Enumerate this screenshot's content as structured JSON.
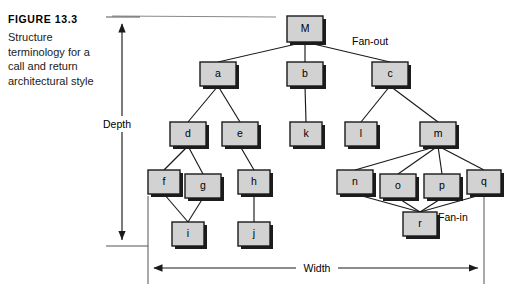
{
  "figure": {
    "label": "FIGURE 13.3",
    "description": "Structure terminology for a call and return architectural style"
  },
  "diagram": {
    "annotations": {
      "fan_out": "Fan-out",
      "fan_in": "Fan-in",
      "depth": "Depth",
      "width": "Width"
    },
    "nodes": [
      {
        "id": "M",
        "label": "M",
        "x": 287,
        "y": 16,
        "w": 36,
        "h": 26
      },
      {
        "id": "a",
        "label": "a",
        "x": 200,
        "y": 62,
        "w": 36,
        "h": 24
      },
      {
        "id": "b",
        "label": "b",
        "x": 287,
        "y": 62,
        "w": 36,
        "h": 24
      },
      {
        "id": "c",
        "label": "c",
        "x": 372,
        "y": 62,
        "w": 36,
        "h": 24
      },
      {
        "id": "d",
        "label": "d",
        "x": 170,
        "y": 122,
        "w": 36,
        "h": 24
      },
      {
        "id": "e",
        "label": "e",
        "x": 222,
        "y": 122,
        "w": 36,
        "h": 24
      },
      {
        "id": "k",
        "label": "k",
        "x": 290,
        "y": 122,
        "w": 32,
        "h": 24
      },
      {
        "id": "l",
        "label": "l",
        "x": 345,
        "y": 122,
        "w": 32,
        "h": 24
      },
      {
        "id": "m",
        "label": "m",
        "x": 420,
        "y": 122,
        "w": 36,
        "h": 24
      },
      {
        "id": "f",
        "label": "f",
        "x": 148,
        "y": 170,
        "w": 32,
        "h": 24
      },
      {
        "id": "g",
        "label": "g",
        "x": 185,
        "y": 174,
        "w": 36,
        "h": 24
      },
      {
        "id": "h",
        "label": "h",
        "x": 238,
        "y": 170,
        "w": 32,
        "h": 24
      },
      {
        "id": "n",
        "label": "n",
        "x": 337,
        "y": 170,
        "w": 36,
        "h": 24
      },
      {
        "id": "o",
        "label": "o",
        "x": 380,
        "y": 174,
        "w": 36,
        "h": 24
      },
      {
        "id": "p",
        "label": "p",
        "x": 424,
        "y": 174,
        "w": 36,
        "h": 24
      },
      {
        "id": "q",
        "label": "q",
        "x": 467,
        "y": 170,
        "w": 34,
        "h": 24
      },
      {
        "id": "i",
        "label": "i",
        "x": 172,
        "y": 222,
        "w": 32,
        "h": 24
      },
      {
        "id": "j",
        "label": "j",
        "x": 238,
        "y": 222,
        "w": 32,
        "h": 24
      },
      {
        "id": "r",
        "label": "r",
        "x": 403,
        "y": 212,
        "w": 34,
        "h": 24
      }
    ],
    "edges": [
      {
        "from": "M",
        "to": "a"
      },
      {
        "from": "M",
        "to": "b"
      },
      {
        "from": "M",
        "to": "c"
      },
      {
        "from": "a",
        "to": "d"
      },
      {
        "from": "a",
        "to": "e"
      },
      {
        "from": "b",
        "to": "k"
      },
      {
        "from": "c",
        "to": "l"
      },
      {
        "from": "c",
        "to": "m"
      },
      {
        "from": "d",
        "to": "f"
      },
      {
        "from": "d",
        "to": "g"
      },
      {
        "from": "e",
        "to": "h"
      },
      {
        "from": "m",
        "to": "n"
      },
      {
        "from": "m",
        "to": "o"
      },
      {
        "from": "m",
        "to": "p"
      },
      {
        "from": "m",
        "to": "q"
      },
      {
        "from": "f",
        "to": "i"
      },
      {
        "from": "g",
        "to": "i"
      },
      {
        "from": "h",
        "to": "j"
      },
      {
        "from": "n",
        "to": "r"
      },
      {
        "from": "o",
        "to": "r"
      },
      {
        "from": "p",
        "to": "r"
      },
      {
        "from": "q",
        "to": "r"
      }
    ]
  }
}
